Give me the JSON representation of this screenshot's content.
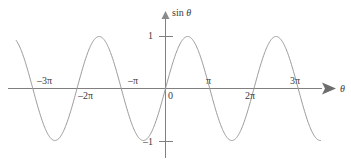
{
  "figure": {
    "name": "sine-function-graph",
    "background_color": "#ffffff",
    "curve_color": "#9a9a9a",
    "axis_color": "#808080",
    "text_color": "#3a3a3a",
    "y_axis_title": "sin ",
    "y_axis_title_var": "θ",
    "x_axis_title": "θ",
    "origin_label": "0"
  },
  "y_ticks": [
    {
      "label": "1",
      "value": 1
    },
    {
      "label": "–1",
      "value": -1
    }
  ],
  "x_ticks": [
    {
      "label": "–3π",
      "value": -9.4248,
      "side": "above"
    },
    {
      "label": "–2π",
      "value": -6.2832,
      "side": "below"
    },
    {
      "label": "–π",
      "value": -3.1416,
      "side": "above"
    },
    {
      "label": "π",
      "value": 3.1416,
      "side": "above"
    },
    {
      "label": "2π",
      "value": 6.2832,
      "side": "below"
    },
    {
      "label": "3π",
      "value": 9.4248,
      "side": "above"
    }
  ],
  "chart_data": {
    "type": "line",
    "title": "",
    "subtitle": "",
    "xlabel": "θ",
    "ylabel": "sin θ",
    "grid": false,
    "legend": "none",
    "xlim": [
      -10.6,
      11.6
    ],
    "ylim": [
      -1.35,
      1.35
    ],
    "x_tick_labels": [
      "–3π",
      "–2π",
      "–π",
      "0",
      "π",
      "2π",
      "3π"
    ],
    "x_tick_values": [
      -9.4248,
      -6.2832,
      -3.1416,
      0,
      3.1416,
      6.2832,
      9.4248
    ],
    "y_tick_labels": [
      "1",
      "–1"
    ],
    "y_tick_values": [
      1,
      -1
    ],
    "series": [
      {
        "name": "sin θ",
        "function": "sin(x)",
        "amplitude": 1,
        "period": 6.2832,
        "phase": 0,
        "x_start": -10.6,
        "x_end": 11.0,
        "color": "#9a9a9a",
        "key_points": [
          {
            "x": -9.4248,
            "y": 0
          },
          {
            "x": -7.854,
            "y": -1
          },
          {
            "x": -6.2832,
            "y": 0
          },
          {
            "x": -4.7124,
            "y": 1
          },
          {
            "x": -3.1416,
            "y": 0
          },
          {
            "x": -1.5708,
            "y": -1
          },
          {
            "x": 0,
            "y": 0
          },
          {
            "x": 1.5708,
            "y": 1
          },
          {
            "x": 3.1416,
            "y": 0
          },
          {
            "x": 4.7124,
            "y": -1
          },
          {
            "x": 6.2832,
            "y": 0
          },
          {
            "x": 7.854,
            "y": 1
          },
          {
            "x": 9.4248,
            "y": 0
          },
          {
            "x": 11.0,
            "y": -0.9998
          }
        ]
      }
    ]
  }
}
